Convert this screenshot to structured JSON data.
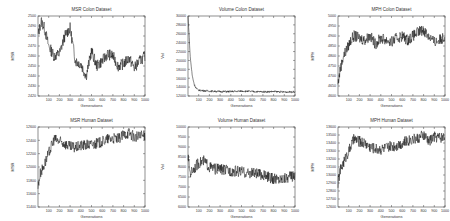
{
  "chart_data": [
    {
      "type": "line",
      "title": "MSR Colon Dataset",
      "xlabel": "Generations",
      "ylabel": "MSR",
      "xlim": [
        0,
        1000
      ],
      "ylim": [
        2420,
        2500
      ],
      "xticks": [
        100,
        200,
        300,
        400,
        500,
        600,
        700,
        800,
        900,
        1000
      ],
      "yticks": [
        2420,
        2430,
        2440,
        2450,
        2460,
        2470,
        2480,
        2490,
        2500
      ],
      "grid": false,
      "series": [
        {
          "name": "MSR",
          "x": [
            0,
            30,
            60,
            100,
            150,
            200,
            250,
            300,
            350,
            400,
            450,
            500,
            550,
            600,
            650,
            700,
            750,
            800,
            850,
            900,
            950,
            1000
          ],
          "values": [
            2480,
            2495,
            2488,
            2470,
            2460,
            2462,
            2480,
            2488,
            2455,
            2452,
            2440,
            2465,
            2450,
            2455,
            2462,
            2460,
            2450,
            2452,
            2458,
            2448,
            2455,
            2460
          ]
        }
      ]
    },
    {
      "type": "line",
      "title": "Volume Colon Dataset",
      "xlabel": "Generations",
      "ylabel": "Vol",
      "xlim": [
        0,
        1000
      ],
      "ylim": [
        12000,
        30000
      ],
      "xticks": [
        100,
        200,
        300,
        400,
        500,
        600,
        700,
        800,
        900,
        1000
      ],
      "yticks": [
        12000,
        14000,
        16000,
        18000,
        20000,
        22000,
        24000,
        26000,
        28000,
        30000
      ],
      "grid": false,
      "series": [
        {
          "name": "Volume",
          "x": [
            0,
            10,
            20,
            40,
            60,
            80,
            100,
            150,
            200,
            300,
            400,
            500,
            600,
            700,
            800,
            900,
            1000
          ],
          "values": [
            30000,
            26000,
            21000,
            16500,
            14500,
            13600,
            13300,
            13200,
            13100,
            13000,
            13000,
            13100,
            13000,
            12950,
            13000,
            12900,
            12950
          ]
        }
      ]
    },
    {
      "type": "line",
      "title": "MPH Colon Dataset",
      "xlabel": "Generations",
      "ylabel": "MPH",
      "xlim": [
        0,
        1000
      ],
      "ylim": [
        4600,
        5000
      ],
      "xticks": [
        100,
        200,
        300,
        400,
        500,
        600,
        700,
        800,
        900,
        1000
      ],
      "yticks": [
        4600,
        4650,
        4700,
        4750,
        4800,
        4850,
        4900,
        4950,
        5000
      ],
      "grid": false,
      "series": [
        {
          "name": "MPH",
          "x": [
            0,
            20,
            50,
            80,
            120,
            150,
            200,
            250,
            300,
            350,
            400,
            450,
            500,
            550,
            600,
            650,
            700,
            750,
            800,
            850,
            900,
            950,
            1000
          ],
          "values": [
            4660,
            4730,
            4800,
            4830,
            4880,
            4900,
            4890,
            4880,
            4900,
            4860,
            4890,
            4880,
            4870,
            4890,
            4900,
            4880,
            4900,
            4920,
            4930,
            4900,
            4870,
            4880,
            4900
          ]
        }
      ]
    },
    {
      "type": "line",
      "title": "MSR Human Dataset",
      "xlabel": "Generations",
      "ylabel": "MSR",
      "xlim": [
        0,
        1000
      ],
      "ylim": [
        11400,
        12600
      ],
      "xticks": [
        100,
        200,
        300,
        400,
        500,
        600,
        700,
        800,
        900,
        1000
      ],
      "yticks": [
        11400,
        11600,
        11800,
        12000,
        12200,
        12400,
        12600
      ],
      "grid": false,
      "series": [
        {
          "name": "MSR",
          "x": [
            0,
            20,
            50,
            100,
            150,
            200,
            250,
            300,
            350,
            400,
            450,
            500,
            550,
            600,
            650,
            700,
            750,
            800,
            850,
            900,
            950,
            1000
          ],
          "values": [
            11700,
            11900,
            12000,
            12200,
            12420,
            12380,
            12350,
            12300,
            12290,
            12320,
            12330,
            12340,
            12350,
            12380,
            12420,
            12430,
            12420,
            12480,
            12520,
            12450,
            12460,
            12470
          ]
        }
      ]
    },
    {
      "type": "line",
      "title": "Volume Human Dataset",
      "xlabel": "Generations",
      "ylabel": "Vol",
      "xlim": [
        0,
        1000
      ],
      "ylim": [
        6000,
        10000
      ],
      "xticks": [
        100,
        200,
        300,
        400,
        500,
        600,
        700,
        800,
        900,
        1000
      ],
      "yticks": [
        6000,
        6500,
        7000,
        7500,
        8000,
        8500,
        9000,
        9500,
        10000
      ],
      "grid": false,
      "series": [
        {
          "name": "Volume",
          "x": [
            0,
            20,
            50,
            100,
            150,
            200,
            250,
            300,
            350,
            400,
            450,
            500,
            550,
            600,
            650,
            700,
            750,
            800,
            850,
            900,
            950,
            1000
          ],
          "values": [
            8500,
            7700,
            7900,
            8200,
            8300,
            8000,
            7900,
            7900,
            7850,
            7800,
            7800,
            7750,
            7700,
            7700,
            7650,
            7600,
            7500,
            7400,
            7400,
            7450,
            7500,
            7600
          ]
        }
      ]
    },
    {
      "type": "line",
      "title": "MPH Human Dataset",
      "xlabel": "Generations",
      "ylabel": "MPH",
      "xlim": [
        0,
        1000
      ],
      "ylim": [
        12600,
        13600
      ],
      "xticks": [
        100,
        200,
        300,
        400,
        500,
        600,
        700,
        800,
        900,
        1000
      ],
      "yticks": [
        12600,
        12700,
        12800,
        12900,
        13000,
        13100,
        13200,
        13300,
        13400,
        13500,
        13600
      ],
      "grid": false,
      "series": [
        {
          "name": "MPH",
          "x": [
            0,
            20,
            50,
            100,
            150,
            200,
            250,
            300,
            350,
            400,
            450,
            500,
            550,
            600,
            650,
            700,
            750,
            800,
            850,
            900,
            950,
            1000
          ],
          "values": [
            12900,
            13050,
            13150,
            13300,
            13450,
            13420,
            13400,
            13350,
            13330,
            13320,
            13340,
            13360,
            13370,
            13400,
            13430,
            13450,
            13460,
            13500,
            13420,
            13480,
            13470,
            13480
          ]
        }
      ]
    }
  ]
}
